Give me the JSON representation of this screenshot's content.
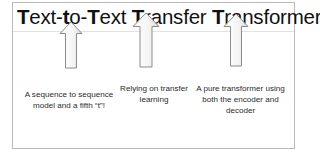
{
  "slide": {
    "title_segments": [
      {
        "text": "T",
        "bold": true
      },
      {
        "text": "ext-",
        "bold": false
      },
      {
        "text": "t",
        "bold": true
      },
      {
        "text": "o-",
        "bold": false
      },
      {
        "text": "T",
        "bold": true
      },
      {
        "text": "ext ",
        "bold": false
      },
      {
        "text": "T",
        "bold": true
      },
      {
        "text": "ransfer ",
        "bold": false
      },
      {
        "text": "T",
        "bold": true
      },
      {
        "text": "ransformer",
        "bold": false
      }
    ],
    "title_plain": "Text-to-Text Transfer Transformer",
    "columns": [
      {
        "arrow_name": "up-arrow-icon-1",
        "caption": "A sequence to sequence model and a fifth “t”!"
      },
      {
        "arrow_name": "up-arrow-icon-2",
        "caption": "Relying on transfer learning"
      },
      {
        "arrow_name": "up-arrow-icon-3",
        "caption": "A pure transformer using both the encoder and decoder"
      }
    ],
    "colors": {
      "frame_border": "#b9b9b9",
      "title_divider": "#e2e2e2",
      "arrow_fill_light": "#fdfdfd",
      "arrow_fill_shade": "#e3e3e3",
      "arrow_stroke": "#8c8c8c",
      "text": "#2b2b2b",
      "title_text": "#111111",
      "background": "#ffffff"
    }
  }
}
